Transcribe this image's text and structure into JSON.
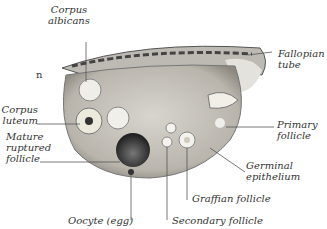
{
  "diagram": {
    "cropped_fragment": "n",
    "labels": {
      "corpus_albicans": [
        "Corpus",
        "albicans"
      ],
      "fallopian_tube": [
        "Fallopian",
        "tube"
      ],
      "corpus_luteum": [
        "Corpus",
        "luteum"
      ],
      "mature_ruptured_follicle": [
        "Mature",
        "ruptured",
        "follicle"
      ],
      "primary_follicle": [
        "Primary",
        "follicle"
      ],
      "germinal_epithelium": [
        "Germinal",
        "epithelium"
      ],
      "graffian_follicle": "Graffian follicle",
      "secondary_follicle": "Secondary follicle",
      "oocyte": "Oocyte (egg)"
    },
    "colors": {
      "tissue": "#c9c6bf",
      "dark": "#3a3a3a",
      "line": "#555555",
      "text": "#333333"
    }
  }
}
